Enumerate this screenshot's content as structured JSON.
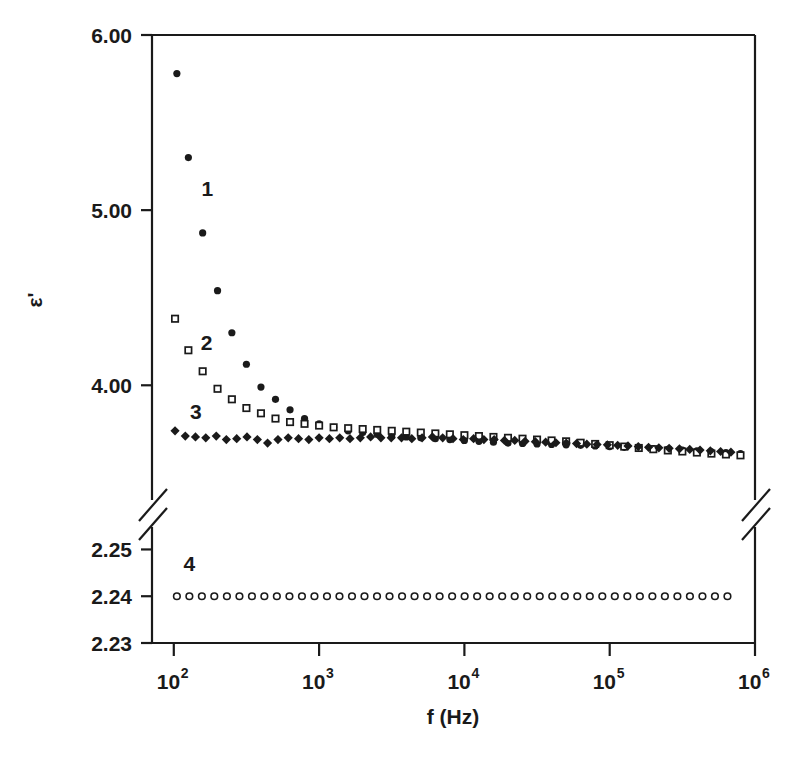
{
  "chart_data": {
    "type": "scatter",
    "title": "",
    "subtitle": "",
    "xlabel": "f (Hz)",
    "ylabel": "ε'",
    "xscale": "log",
    "xlim": [
      100,
      1000000
    ],
    "xtick_labels": [
      "10",
      "10",
      "10",
      "10",
      "10"
    ],
    "xtick_exponents": [
      "2",
      "3",
      "4",
      "5",
      "6"
    ],
    "xtick_values": [
      100,
      1000,
      10000,
      100000,
      1000000
    ],
    "grid": false,
    "legend_position": "inline-annotations",
    "axis_break": {
      "present": true,
      "upper_range": [
        3.55,
        6.0
      ],
      "lower_range": [
        2.23,
        2.25
      ],
      "note": "y-axis is broken between 2.25 and the lower bound of the upper panel"
    },
    "y_upper": {
      "ticks": [
        4.0,
        5.0,
        6.0
      ],
      "tick_labels": [
        "4.00",
        "5.00",
        "6.00"
      ],
      "range": [
        3.55,
        6.0
      ]
    },
    "y_lower": {
      "ticks": [
        2.23,
        2.24,
        2.25
      ],
      "tick_labels": [
        "2.23",
        "2.24",
        "2.25"
      ],
      "range": [
        2.23,
        2.25
      ]
    },
    "annotations": [
      {
        "text": "1",
        "x": 170,
        "y": 5.08,
        "series": 1
      },
      {
        "text": "2",
        "x": 168,
        "y": 4.2,
        "series": 2
      },
      {
        "text": "3",
        "x": 142,
        "y": 3.81,
        "series": 3
      },
      {
        "text": "4",
        "x": 128,
        "y": 2.2455,
        "series": 4
      }
    ],
    "series": [
      {
        "name": "1",
        "marker": "filled-circle",
        "color": "#1a1a1a",
        "panel": "upper",
        "x": [
          105,
          126,
          158,
          200,
          251,
          316,
          398,
          501,
          631,
          794,
          1000,
          1259,
          1585,
          1995,
          2512,
          3162,
          3981,
          5012,
          6310,
          7943,
          10000,
          12589,
          15849,
          19953,
          25119,
          31623,
          39811,
          50119,
          63096,
          79433,
          100000,
          125893,
          158489,
          199526,
          251189,
          316228,
          398107,
          501187,
          630957,
          794328
        ],
        "y": [
          5.78,
          5.3,
          4.87,
          4.54,
          4.3,
          4.12,
          3.99,
          3.92,
          3.86,
          3.81,
          3.78,
          3.76,
          3.74,
          3.73,
          3.72,
          3.71,
          3.705,
          3.7,
          3.695,
          3.69,
          3.685,
          3.68,
          3.675,
          3.67,
          3.668,
          3.665,
          3.662,
          3.66,
          3.657,
          3.654,
          3.65,
          3.646,
          3.642,
          3.638,
          3.634,
          3.63,
          3.625,
          3.62,
          3.615,
          3.61
        ]
      },
      {
        "name": "2",
        "marker": "open-square",
        "color": "#1a1a1a",
        "panel": "upper",
        "x": [
          102,
          126,
          158,
          200,
          251,
          316,
          398,
          501,
          631,
          794,
          1000,
          1259,
          1585,
          1995,
          2512,
          3162,
          3981,
          5012,
          6310,
          7943,
          10000,
          12589,
          15849,
          19953,
          25119,
          31623,
          39811,
          50119,
          63096,
          79433,
          100000,
          125893,
          158489,
          199526,
          251189,
          316228,
          398107,
          501187,
          630957,
          794328
        ],
        "y": [
          4.38,
          4.2,
          4.08,
          3.98,
          3.92,
          3.87,
          3.84,
          3.81,
          3.79,
          3.78,
          3.77,
          3.76,
          3.755,
          3.75,
          3.745,
          3.74,
          3.735,
          3.73,
          3.725,
          3.72,
          3.715,
          3.71,
          3.705,
          3.7,
          3.695,
          3.69,
          3.685,
          3.68,
          3.672,
          3.665,
          3.658,
          3.65,
          3.642,
          3.635,
          3.628,
          3.622,
          3.616,
          3.61,
          3.605,
          3.6
        ]
      },
      {
        "name": "3",
        "marker": "filled-diamond",
        "color": "#1a1a1a",
        "panel": "upper",
        "x": [
          102,
          120,
          141,
          166,
          196,
          230,
          271,
          319,
          376,
          442,
          521,
          613,
          722,
          850,
          1000,
          1178,
          1387,
          1632,
          1922,
          2263,
          2664,
          3136,
          3692,
          4346,
          5116,
          6023,
          7090,
          8346,
          9824,
          11565,
          13615,
          16029,
          18869,
          22212,
          26150,
          30784,
          36240,
          42658,
          50214,
          59110,
          69584,
          81905,
          96411,
          113493,
          133600,
          157270,
          185130,
          217930,
          256540,
          302000,
          355500,
          418500,
          492600,
          579900,
          682600
        ],
        "y": [
          3.74,
          3.71,
          3.705,
          3.7,
          3.71,
          3.69,
          3.695,
          3.705,
          3.69,
          3.67,
          3.69,
          3.7,
          3.695,
          3.69,
          3.7,
          3.695,
          3.7,
          3.695,
          3.7,
          3.705,
          3.7,
          3.7,
          3.7,
          3.695,
          3.7,
          3.705,
          3.7,
          3.695,
          3.69,
          3.695,
          3.69,
          3.69,
          3.685,
          3.685,
          3.68,
          3.678,
          3.675,
          3.672,
          3.67,
          3.667,
          3.664,
          3.662,
          3.66,
          3.657,
          3.654,
          3.65,
          3.646,
          3.643,
          3.64,
          3.637,
          3.634,
          3.63,
          3.626,
          3.622,
          3.618
        ]
      },
      {
        "name": "4",
        "marker": "open-circle",
        "color": "#1a1a1a",
        "panel": "lower",
        "x": [
          105,
          128,
          156,
          190,
          232,
          283,
          345,
          420,
          512,
          625,
          762,
          929,
          1133,
          1381,
          1684,
          2053,
          2504,
          3053,
          3723,
          4540,
          5536,
          6750,
          8231,
          10036,
          12237,
          14922,
          18196,
          22188,
          27055,
          32992,
          40231,
          49057,
          59818,
          72938,
          88938,
          108450,
          132240,
          161250,
          196630,
          239760,
          292360,
          356510,
          434710,
          530050,
          646330
        ],
        "y": [
          2.24,
          2.24,
          2.24,
          2.24,
          2.24,
          2.24,
          2.24,
          2.24,
          2.24,
          2.24,
          2.24,
          2.24,
          2.24,
          2.24,
          2.24,
          2.24,
          2.24,
          2.24,
          2.24,
          2.24,
          2.24,
          2.24,
          2.24,
          2.24,
          2.24,
          2.24,
          2.24,
          2.24,
          2.24,
          2.24,
          2.24,
          2.24,
          2.24,
          2.24,
          2.24,
          2.24,
          2.24,
          2.24,
          2.24,
          2.24,
          2.24,
          2.24,
          2.24,
          2.24,
          2.24
        ]
      }
    ]
  },
  "figure": {
    "background_color": "#ffffff",
    "ink_color": "#1a1a1a"
  }
}
